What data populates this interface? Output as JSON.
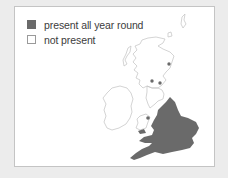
{
  "legend": {
    "items": [
      {
        "label": "present all year round",
        "swatch": "filled",
        "color": "#6a6a6a"
      },
      {
        "label": "not present",
        "swatch": "empty",
        "color": "#ffffff"
      }
    ]
  },
  "map": {
    "region": "Great Britain and Ireland",
    "fill_color": "#6a6a6a",
    "outline_color": "#bdbdbd",
    "filled_area": "England and Wales (south and east)",
    "point_markers": 3
  }
}
